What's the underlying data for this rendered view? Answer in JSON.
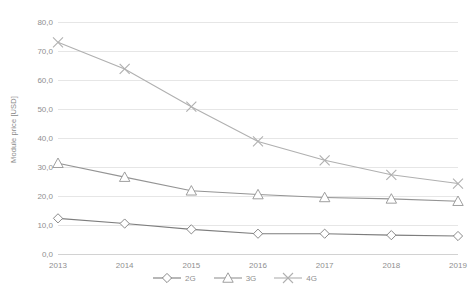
{
  "chart_data": {
    "type": "line",
    "title": "",
    "xlabel": "",
    "ylabel": "Module price [USD]",
    "categories": [
      "2013",
      "2014",
      "2015",
      "2016",
      "2017",
      "2018",
      "2019"
    ],
    "x": [
      2013,
      2014,
      2015,
      2016,
      2017,
      2018,
      2019
    ],
    "ylim": [
      0,
      80
    ],
    "yticks": [
      0,
      10,
      20,
      30,
      40,
      50,
      60,
      70,
      80
    ],
    "ytick_labels": [
      "0,0",
      "10,0",
      "20,0",
      "30,0",
      "40,0",
      "50,0",
      "60,0",
      "70,0",
      "80,0"
    ],
    "grid": true,
    "legend_position": "bottom",
    "decimal_separator": ",",
    "series": [
      {
        "name": "2G",
        "marker": "diamond",
        "color": "#7d7d7d",
        "values": [
          12.3,
          10.5,
          8.5,
          7.0,
          7.0,
          6.5,
          6.2
        ]
      },
      {
        "name": "3G",
        "marker": "triangle",
        "color": "#949494",
        "values": [
          31.3,
          26.5,
          21.8,
          20.5,
          19.5,
          19.0,
          18.2
        ]
      },
      {
        "name": "4G",
        "marker": "x",
        "color": "#b0b0b0",
        "values": [
          73.0,
          63.8,
          50.8,
          38.8,
          32.3,
          27.3,
          24.3
        ]
      }
    ]
  },
  "legend": {
    "items": [
      {
        "label": "2G"
      },
      {
        "label": "3G"
      },
      {
        "label": "4G"
      }
    ]
  },
  "colors": {
    "gridline": "#e6e6e6",
    "axis": "#d2d2d2",
    "tick_text": "#8f8f8f",
    "background": "#ffffff"
  }
}
